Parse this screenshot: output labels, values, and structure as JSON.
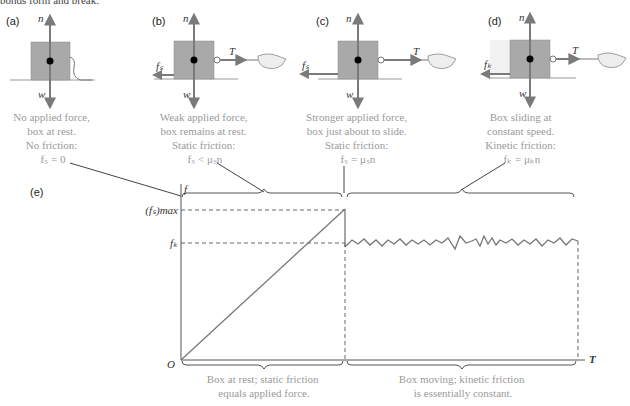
{
  "header": {
    "partial_text": "bonds form and break."
  },
  "panels": [
    {
      "id": "a",
      "label": "(a)",
      "forces": {
        "n": "n",
        "w": "w"
      },
      "caption": [
        "No applied force,",
        "box at rest.",
        "No friction:",
        "fₛ = 0"
      ]
    },
    {
      "id": "b",
      "label": "(b)",
      "forces": {
        "n": "n",
        "w": "w",
        "T": "T",
        "f": "fₛ"
      },
      "caption": [
        "Weak applied force,",
        "box remains at rest.",
        "Static friction:",
        "fₛ < μₛn"
      ]
    },
    {
      "id": "c",
      "label": "(c)",
      "forces": {
        "n": "n",
        "w": "w",
        "T": "T",
        "f": "fₛ"
      },
      "caption": [
        "Stronger applied force,",
        "box just about to slide.",
        "Static friction:",
        "fₛ = μₛn"
      ]
    },
    {
      "id": "d",
      "label": "(d)",
      "forces": {
        "n": "n",
        "w": "w",
        "T": "T",
        "f": "fₖ"
      },
      "caption": [
        "Box sliding at",
        "constant speed.",
        "Kinetic friction:",
        "fₖ = μₖn"
      ]
    }
  ],
  "graph": {
    "label": "(e)",
    "y_axis_label": "f",
    "x_axis_label": "T",
    "origin_label": "O",
    "y_ticks": [
      "(fₛ)max",
      "fₖ"
    ],
    "bottom_captions": {
      "left": [
        "Box at rest; static friction",
        "equals applied force."
      ],
      "right": [
        "Box moving; kinetic friction",
        "is essentially constant."
      ]
    }
  },
  "colors": {
    "box": "#a9a9a9",
    "arrow": "#7a7a7a",
    "caption": "#9a9a9a",
    "axis": "#555555"
  }
}
